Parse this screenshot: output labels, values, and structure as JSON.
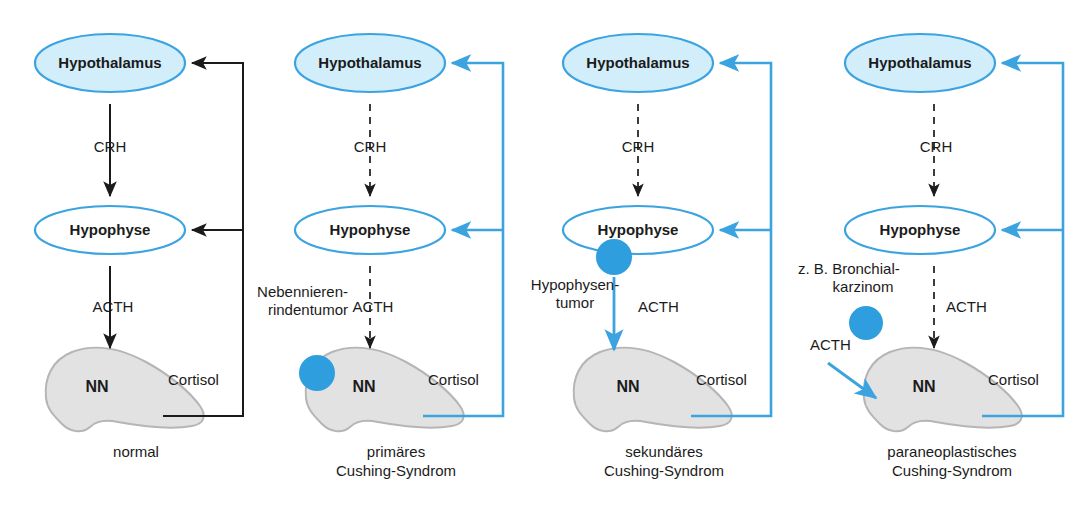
{
  "figure": {
    "colors": {
      "blue_stroke": "#3aa3e0",
      "blue_fill_node": "#d2eefb",
      "blue_dot": "#2e9ede",
      "gland_fill": "#e2e2e2",
      "gland_stroke": "#b5b5b5",
      "black": "#1b1b1b",
      "white": "#ffffff"
    },
    "node_labels": {
      "hypothalamus": "Hypothalamus",
      "hypophyse": "Hypophyse",
      "nebenniere": "NN"
    },
    "hormone_labels": {
      "crh": "CRH",
      "acth": "ACTH",
      "cortisol": "Cortisol"
    }
  },
  "panels": [
    {
      "id": "normal",
      "caption": "normal",
      "hypothalamus": "Hypothalamus",
      "hypophyse": "Hypophyse",
      "nebenniere": "NN",
      "crh": "CRH",
      "acth": "ACTH",
      "cortisol": "Cortisol",
      "tumor_label": "",
      "tumor_label_2": "",
      "extra_acth": "",
      "crh_style": "solid-black",
      "acth_style": "solid-black",
      "feedback_style": "black",
      "tumor": "none"
    },
    {
      "id": "primaeres-cushing-syndrom",
      "caption": "primäres\nCushing-Syndrom",
      "hypothalamus": "Hypothalamus",
      "hypophyse": "Hypophyse",
      "nebenniere": "NN",
      "crh": "CRH",
      "acth": "ACTH",
      "cortisol": "Cortisol",
      "tumor_label": "Nebennieren-",
      "tumor_label_2": "rindentumor",
      "extra_acth": "",
      "crh_style": "dashed-black",
      "acth_style": "dashed-black",
      "feedback_style": "blue",
      "tumor": "adrenal"
    },
    {
      "id": "sekundaeres-cushing-syndrom",
      "caption": "sekundäres\nCushing-Syndrom",
      "hypothalamus": "Hypothalamus",
      "hypophyse": "Hypophyse",
      "nebenniere": "NN",
      "crh": "CRH",
      "acth": "ACTH",
      "cortisol": "Cortisol",
      "tumor_label": "Hypophysen-",
      "tumor_label_2": "tumor",
      "extra_acth": "",
      "crh_style": "dashed-black",
      "acth_style": "solid-blue",
      "feedback_style": "blue",
      "tumor": "pituitary"
    },
    {
      "id": "paraneoplastisches-cushing-syndrom",
      "caption": "paraneoplastisches\nCushing-Syndrom",
      "hypothalamus": "Hypothalamus",
      "hypophyse": "Hypophyse",
      "nebenniere": "NN",
      "crh": "CRH",
      "acth": "ACTH",
      "cortisol": "Cortisol",
      "tumor_label": "z. B. Bronchial-",
      "tumor_label_2": "karzinom",
      "extra_acth": "ACTH",
      "crh_style": "dashed-black",
      "acth_style": "dashed-black",
      "feedback_style": "blue",
      "tumor": "ectopic"
    }
  ]
}
